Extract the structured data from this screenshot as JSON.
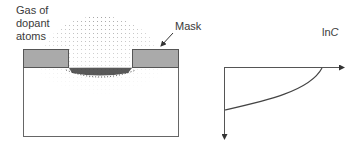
{
  "diagram": {
    "labels": {
      "gas_line1": "Gas of",
      "gas_line2": "dopant",
      "gas_line3": "atoms",
      "mask": "Mask",
      "ln": "ln",
      "c": "C"
    },
    "colors": {
      "mask_fill": "#aaaaaa",
      "outline": "#555555",
      "dopant": "#222222"
    },
    "profile_plot": {
      "y_axis_label": "lnC",
      "x_axis": "horizontal, arrow right",
      "depth_axis": "vertical, arrow down",
      "curve": "concentration decreasing with depth"
    }
  }
}
